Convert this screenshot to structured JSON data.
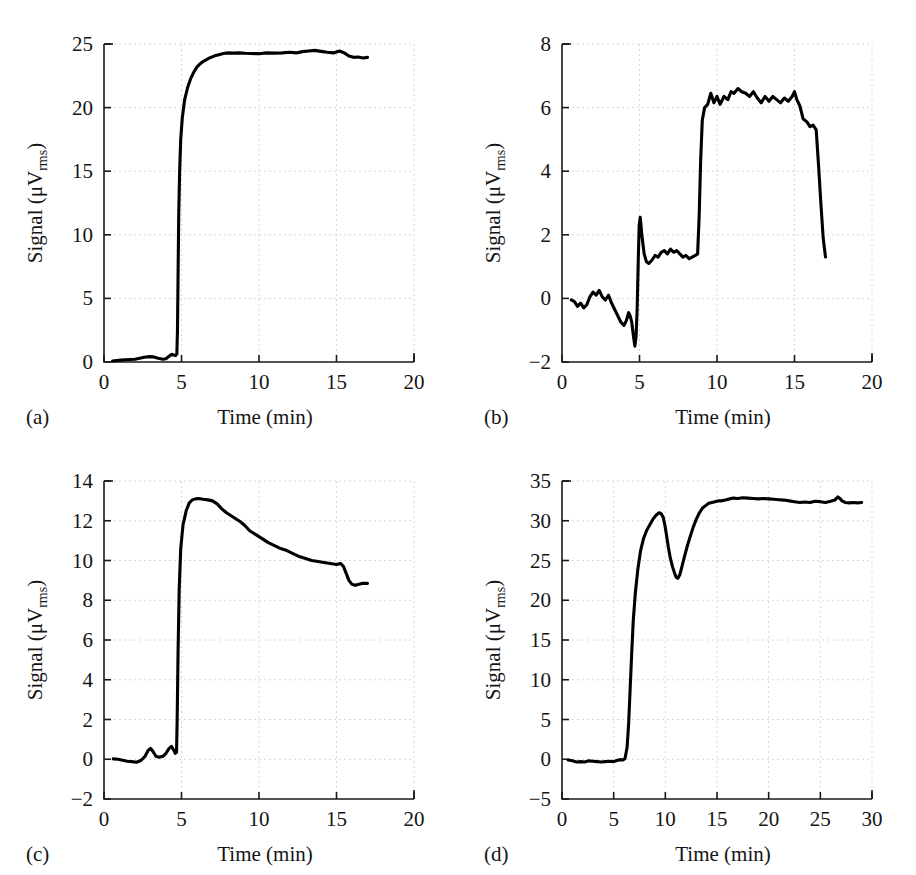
{
  "figure": {
    "panel_count": 4,
    "background_color": "#ffffff",
    "trace_color": "#000000",
    "grid_color": "#d8d8d8",
    "axis_color": "#1a1a1a"
  },
  "panels": [
    {
      "id": "a",
      "tag": "(a)",
      "xlabel": "Time (min)",
      "ylabel_main": "Signal (",
      "ylabel_mu": "μV",
      "ylabel_sub": "rms",
      "ylabel_close": ")"
    },
    {
      "id": "b",
      "tag": "(b)",
      "xlabel": "Time (min)",
      "ylabel_main": "Signal (",
      "ylabel_mu": "μV",
      "ylabel_sub": "rms",
      "ylabel_close": ")"
    },
    {
      "id": "c",
      "tag": "(c)",
      "xlabel": "Time (min)",
      "ylabel_main": "Signal (",
      "ylabel_mu": "μV",
      "ylabel_sub": "rms",
      "ylabel_close": ")"
    },
    {
      "id": "d",
      "tag": "(d)",
      "xlabel": "Time (min)",
      "ylabel_main": "Signal (",
      "ylabel_mu": "μV",
      "ylabel_sub": "rms",
      "ylabel_close": ")"
    }
  ],
  "chart_data": [
    {
      "panel": "a",
      "type": "line",
      "title": "",
      "xlabel": "Time (min)",
      "ylabel": "Signal (μVrms)",
      "xlim": [
        0,
        20
      ],
      "ylim": [
        0,
        25
      ],
      "xticks": [
        0,
        5,
        10,
        15,
        20
      ],
      "yticks": [
        0,
        5,
        10,
        15,
        20,
        25
      ],
      "xticklabels": [
        "0",
        "5",
        "10",
        "15",
        "20"
      ],
      "yticklabels": [
        "0",
        "5",
        "10",
        "15",
        "20",
        "25"
      ],
      "grid": true,
      "legend": null,
      "series": [
        {
          "name": "signal",
          "x": [
            0.55,
            0.8,
            1.1,
            1.4,
            1.7,
            2.0,
            2.3,
            2.6,
            2.9,
            3.2,
            3.5,
            3.8,
            4.0,
            4.2,
            4.35,
            4.5,
            4.62,
            4.7,
            4.74,
            4.78,
            4.82,
            4.88,
            4.95,
            5.05,
            5.2,
            5.4,
            5.6,
            5.8,
            6.0,
            6.25,
            6.5,
            6.8,
            7.1,
            7.4,
            7.7,
            8.0,
            8.3,
            8.7,
            9.1,
            9.5,
            10.0,
            10.5,
            11.0,
            11.5,
            12.0,
            12.4,
            12.8,
            13.2,
            13.6,
            14.0,
            14.4,
            14.8,
            15.2,
            15.5,
            15.8,
            16.1,
            16.4,
            16.7,
            17.0
          ],
          "y": [
            0.08,
            0.12,
            0.15,
            0.18,
            0.2,
            0.22,
            0.3,
            0.38,
            0.42,
            0.4,
            0.3,
            0.22,
            0.25,
            0.45,
            0.6,
            0.55,
            0.5,
            0.62,
            2.5,
            7.0,
            11.5,
            15.0,
            17.5,
            19.2,
            20.6,
            21.6,
            22.3,
            22.8,
            23.2,
            23.5,
            23.7,
            23.9,
            24.05,
            24.15,
            24.25,
            24.3,
            24.28,
            24.3,
            24.27,
            24.25,
            24.24,
            24.3,
            24.28,
            24.3,
            24.35,
            24.3,
            24.4,
            24.45,
            24.5,
            24.42,
            24.35,
            24.3,
            24.45,
            24.3,
            24.05,
            23.95,
            23.98,
            23.9,
            23.95
          ]
        }
      ]
    },
    {
      "panel": "b",
      "type": "line",
      "title": "",
      "xlabel": "Time (min)",
      "ylabel": "Signal (μVrms)",
      "xlim": [
        0,
        20
      ],
      "ylim": [
        -2,
        8
      ],
      "xticks": [
        0,
        5,
        10,
        15,
        20
      ],
      "yticks": [
        -2,
        0,
        2,
        4,
        6,
        8
      ],
      "xticklabels": [
        "0",
        "5",
        "10",
        "15",
        "20"
      ],
      "yticklabels": [
        "−2",
        "0",
        "2",
        "4",
        "6",
        "8"
      ],
      "grid": true,
      "legend": null,
      "series": [
        {
          "name": "signal",
          "x": [
            0.6,
            0.8,
            1.0,
            1.2,
            1.4,
            1.6,
            1.8,
            2.0,
            2.2,
            2.4,
            2.6,
            2.8,
            3.0,
            3.2,
            3.4,
            3.6,
            3.8,
            4.0,
            4.15,
            4.3,
            4.4,
            4.5,
            4.6,
            4.7,
            4.78,
            4.85,
            4.92,
            4.98,
            5.05,
            5.15,
            5.3,
            5.45,
            5.6,
            5.8,
            6.0,
            6.2,
            6.4,
            6.6,
            6.8,
            7.0,
            7.2,
            7.4,
            7.6,
            7.8,
            8.0,
            8.2,
            8.4,
            8.6,
            8.75,
            8.85,
            8.95,
            9.05,
            9.2,
            9.4,
            9.6,
            9.8,
            10.0,
            10.2,
            10.45,
            10.7,
            10.9,
            11.1,
            11.35,
            11.6,
            11.85,
            12.1,
            12.35,
            12.6,
            12.85,
            13.1,
            13.35,
            13.6,
            13.85,
            14.1,
            14.35,
            14.6,
            14.85,
            15.0,
            15.15,
            15.35,
            15.55,
            15.8,
            16.0,
            16.2,
            16.4,
            16.55,
            16.7,
            16.85,
            17.0
          ],
          "y": [
            -0.05,
            -0.1,
            -0.25,
            -0.15,
            -0.3,
            -0.2,
            0.05,
            0.2,
            0.1,
            0.25,
            0.05,
            -0.05,
            0.1,
            -0.15,
            -0.35,
            -0.55,
            -0.75,
            -0.85,
            -0.7,
            -0.45,
            -0.55,
            -0.75,
            -1.15,
            -1.5,
            -1.2,
            -0.3,
            1.2,
            2.3,
            2.55,
            2.0,
            1.4,
            1.15,
            1.1,
            1.2,
            1.35,
            1.3,
            1.45,
            1.5,
            1.4,
            1.55,
            1.45,
            1.5,
            1.4,
            1.3,
            1.35,
            1.25,
            1.3,
            1.35,
            1.4,
            2.6,
            4.4,
            5.6,
            6.0,
            6.1,
            6.45,
            6.15,
            6.35,
            6.1,
            6.35,
            6.25,
            6.5,
            6.45,
            6.6,
            6.5,
            6.45,
            6.35,
            6.5,
            6.3,
            6.15,
            6.35,
            6.2,
            6.35,
            6.25,
            6.15,
            6.3,
            6.2,
            6.35,
            6.5,
            6.25,
            6.05,
            5.65,
            5.55,
            5.4,
            5.45,
            5.3,
            4.2,
            3.0,
            1.9,
            1.3
          ]
        }
      ]
    },
    {
      "panel": "c",
      "type": "line",
      "title": "",
      "xlabel": "Time (min)",
      "ylabel": "Signal (μVrms)",
      "xlim": [
        0,
        20
      ],
      "ylim": [
        -2,
        14
      ],
      "xticks": [
        0,
        5,
        10,
        15,
        20
      ],
      "yticks": [
        -2,
        0,
        2,
        4,
        6,
        8,
        10,
        12,
        14
      ],
      "xticklabels": [
        "0",
        "5",
        "10",
        "15",
        "20"
      ],
      "yticklabels": [
        "−2",
        "0",
        "2",
        "4",
        "6",
        "8",
        "10",
        "12",
        "14"
      ],
      "grid": true,
      "legend": null,
      "series": [
        {
          "name": "signal",
          "x": [
            0.6,
            0.9,
            1.2,
            1.5,
            1.8,
            2.1,
            2.4,
            2.65,
            2.85,
            3.0,
            3.15,
            3.35,
            3.55,
            3.8,
            4.0,
            4.2,
            4.35,
            4.5,
            4.6,
            4.68,
            4.72,
            4.78,
            4.85,
            4.95,
            5.1,
            5.3,
            5.5,
            5.7,
            5.9,
            6.1,
            6.4,
            6.7,
            7.0,
            7.3,
            7.6,
            7.9,
            8.2,
            8.5,
            8.8,
            9.1,
            9.4,
            9.8,
            10.2,
            10.6,
            11.0,
            11.4,
            11.8,
            12.2,
            12.6,
            13.0,
            13.4,
            13.8,
            14.2,
            14.6,
            15.0,
            15.25,
            15.45,
            15.6,
            15.8,
            16.0,
            16.2,
            16.45,
            16.7,
            17.0
          ],
          "y": [
            0.02,
            0.0,
            -0.05,
            -0.1,
            -0.12,
            -0.15,
            -0.05,
            0.15,
            0.45,
            0.55,
            0.4,
            0.15,
            0.1,
            0.15,
            0.3,
            0.55,
            0.65,
            0.45,
            0.3,
            0.35,
            2.0,
            5.5,
            8.5,
            10.6,
            11.8,
            12.5,
            12.9,
            13.05,
            13.1,
            13.12,
            13.08,
            13.05,
            13.0,
            12.85,
            12.6,
            12.4,
            12.25,
            12.1,
            11.95,
            11.75,
            11.5,
            11.3,
            11.1,
            10.9,
            10.75,
            10.6,
            10.5,
            10.35,
            10.2,
            10.1,
            10.0,
            9.95,
            9.9,
            9.85,
            9.8,
            9.85,
            9.7,
            9.4,
            9.0,
            8.8,
            8.75,
            8.8,
            8.85,
            8.85
          ]
        }
      ]
    },
    {
      "panel": "d",
      "type": "line",
      "title": "",
      "xlabel": "Time (min)",
      "ylabel": "Signal (μVrms)",
      "xlim": [
        0,
        30
      ],
      "ylim": [
        -5,
        35
      ],
      "xticks": [
        0,
        5,
        10,
        15,
        20,
        25,
        30
      ],
      "yticks": [
        -5,
        0,
        5,
        10,
        15,
        20,
        25,
        30,
        35
      ],
      "xticklabels": [
        "0",
        "5",
        "10",
        "15",
        "20",
        "25",
        "30"
      ],
      "yticklabels": [
        "−5",
        "0",
        "5",
        "10",
        "15",
        "20",
        "25",
        "30",
        "35"
      ],
      "grid": true,
      "legend": null,
      "series": [
        {
          "name": "signal",
          "x": [
            0.6,
            1.0,
            1.4,
            1.8,
            2.2,
            2.6,
            3.0,
            3.4,
            3.8,
            4.2,
            4.6,
            5.0,
            5.3,
            5.6,
            5.9,
            6.1,
            6.3,
            6.45,
            6.6,
            6.75,
            6.9,
            7.1,
            7.35,
            7.6,
            7.9,
            8.2,
            8.5,
            8.8,
            9.1,
            9.4,
            9.6,
            9.8,
            9.95,
            10.1,
            10.3,
            10.5,
            10.7,
            10.9,
            11.05,
            11.2,
            11.4,
            11.6,
            11.85,
            12.1,
            12.4,
            12.7,
            13.0,
            13.3,
            13.6,
            13.9,
            14.2,
            14.5,
            14.8,
            15.1,
            15.4,
            15.8,
            16.2,
            16.6,
            17.0,
            17.5,
            18.0,
            18.5,
            19.0,
            19.5,
            20.0,
            20.5,
            21.0,
            21.5,
            22.0,
            22.5,
            23.0,
            23.5,
            24.0,
            24.5,
            25.0,
            25.5,
            26.0,
            26.4,
            26.7,
            26.9,
            27.1,
            27.4,
            27.8,
            28.2,
            28.6,
            29.0
          ],
          "y": [
            -0.1,
            -0.2,
            -0.35,
            -0.3,
            -0.35,
            -0.2,
            -0.25,
            -0.3,
            -0.35,
            -0.3,
            -0.25,
            -0.3,
            -0.15,
            -0.05,
            -0.1,
            0.1,
            1.5,
            4.5,
            9.0,
            13.5,
            17.5,
            21.0,
            24.0,
            26.2,
            27.8,
            28.8,
            29.5,
            30.2,
            30.7,
            31.0,
            30.9,
            30.4,
            29.5,
            28.3,
            26.6,
            25.2,
            24.2,
            23.4,
            22.9,
            22.75,
            23.2,
            24.2,
            25.5,
            26.7,
            28.0,
            29.2,
            30.2,
            31.0,
            31.6,
            31.9,
            32.2,
            32.3,
            32.4,
            32.5,
            32.5,
            32.6,
            32.75,
            32.85,
            32.8,
            32.9,
            32.85,
            32.8,
            32.75,
            32.8,
            32.75,
            32.7,
            32.65,
            32.6,
            32.5,
            32.4,
            32.3,
            32.35,
            32.3,
            32.45,
            32.4,
            32.3,
            32.45,
            32.6,
            33.0,
            32.8,
            32.5,
            32.3,
            32.25,
            32.3,
            32.25,
            32.3
          ]
        }
      ]
    }
  ]
}
